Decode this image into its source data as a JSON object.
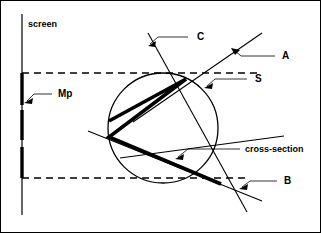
{
  "figure": {
    "background_color": "#ffffff",
    "stroke_color": "#000000",
    "width": 321,
    "height": 233
  },
  "labels": {
    "screen": "screen",
    "mp": "Mp",
    "c": "C",
    "a": "A",
    "s": "S",
    "cross_section": "cross-section",
    "b": "B"
  },
  "geometry": {
    "screen_line": {
      "x": 22,
      "y1": 14,
      "y2": 215
    },
    "dashed_lines": [
      {
        "name": "upper",
        "y": 73,
        "x1": 22,
        "x2": 258
      },
      {
        "name": "lower",
        "y": 178,
        "x1": 22,
        "x2": 250
      }
    ],
    "mp_bar": {
      "x": 22,
      "y1": 73,
      "y2": 178
    },
    "circle": {
      "cx": 163,
      "cy": 128,
      "r": 55
    },
    "line_a": {
      "x1": 133,
      "y1": 122,
      "x2": 262,
      "y2": 33
    },
    "line_b": {
      "x1": 120,
      "y1": 158,
      "x2": 284,
      "y2": 136
    },
    "line_c": {
      "x1": 148,
      "y1": 33,
      "x2": 247,
      "y2": 212
    },
    "line_d": {
      "x1": 88,
      "y1": 131,
      "x2": 262,
      "y2": 201
    },
    "cross_section_polyline": [
      {
        "x": 109,
        "y": 121
      },
      {
        "x": 186,
        "y": 79
      },
      {
        "x": 109,
        "y": 137
      },
      {
        "x": 221,
        "y": 184
      }
    ]
  },
  "annotations": [
    {
      "id": "c-callout",
      "label": "C",
      "label_x": 197,
      "label_y": 40,
      "leader": [
        [
          188,
          37
        ],
        [
          158,
          37
        ],
        [
          150,
          44
        ]
      ]
    },
    {
      "id": "a-callout",
      "label": "A",
      "label_x": 282,
      "label_y": 59,
      "leader": [
        [
          275,
          56
        ],
        [
          241,
          56
        ],
        [
          232,
          50
        ]
      ]
    },
    {
      "id": "s-callout",
      "label": "S",
      "label_x": 255,
      "label_y": 82,
      "leader": [
        [
          247,
          79
        ],
        [
          215,
          79
        ],
        [
          206,
          86
        ]
      ]
    },
    {
      "id": "mp-callout",
      "label": "Mp",
      "label_x": 58,
      "label_y": 97,
      "leader": [
        [
          52,
          94
        ],
        [
          34,
          94
        ],
        [
          25,
          101
        ]
      ]
    },
    {
      "id": "cross-section-callout",
      "label": "cross-section",
      "label_x": 245,
      "label_y": 152,
      "leader": [
        [
          240,
          149
        ],
        [
          188,
          149
        ],
        [
          176,
          157
        ]
      ]
    },
    {
      "id": "b-callout",
      "label": "B",
      "label_x": 284,
      "label_y": 184,
      "leader": [
        [
          277,
          181
        ],
        [
          250,
          181
        ],
        [
          240,
          187
        ]
      ]
    }
  ]
}
